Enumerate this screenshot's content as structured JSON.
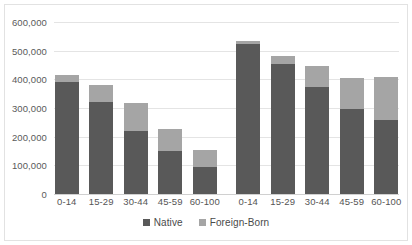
{
  "chart_data": {
    "type": "bar",
    "title": "",
    "subtitle": "",
    "xlabel": "",
    "ylabel": "",
    "stacked": true,
    "grid": true,
    "legend_position": "bottom",
    "ylim": [
      0,
      600000
    ],
    "ytick_labels": [
      "600,000",
      "500,000",
      "400,000",
      "300,000",
      "200,000",
      "100,000",
      "0"
    ],
    "ytick_values": [
      600000,
      500000,
      400000,
      300000,
      200000,
      100000,
      0
    ],
    "categories": [
      "0-14",
      "15-29",
      "30-44",
      "45-59",
      "60-100",
      "0-14",
      "15-29",
      "30-44",
      "45-59",
      "60-100"
    ],
    "group_gap_after_index": 4,
    "series": [
      {
        "name": "Native",
        "color": "#595959",
        "values": [
          390000,
          320000,
          220000,
          150000,
          95000,
          525000,
          455000,
          375000,
          295000,
          258000
        ]
      },
      {
        "name": "Foreign-Born",
        "color": "#a5a5a5",
        "values": [
          25000,
          60000,
          98000,
          78000,
          57000,
          10000,
          28000,
          70000,
          108000,
          150000
        ]
      }
    ],
    "totals": [
      415000,
      380000,
      318000,
      228000,
      152000,
      535000,
      483000,
      445000,
      403000,
      408000
    ]
  },
  "legend": {
    "items": [
      {
        "label": "Native",
        "color": "#595959"
      },
      {
        "label": "Foreign-Born",
        "color": "#a5a5a5"
      }
    ]
  }
}
